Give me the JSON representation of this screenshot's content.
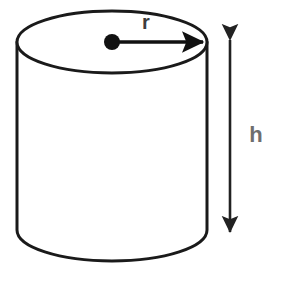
{
  "diagram": {
    "background_color": "#ffffff",
    "stroke_color": "#1a1a1a",
    "canvas": {
      "width": 281,
      "height": 281
    },
    "shape": {
      "name": "cylinder",
      "top_ellipse": {
        "cx": 112,
        "cy": 42,
        "rx": 95,
        "ry": 31
      },
      "bottom_arc": {
        "cx": 112,
        "cy": 230,
        "rx": 95,
        "ry": 31
      },
      "left_wall": {
        "x": 17,
        "y1": 42,
        "y2": 230
      },
      "right_wall": {
        "x": 207,
        "y1": 42,
        "y2": 230
      },
      "stroke_width": 3
    },
    "radius_marker": {
      "label": "r",
      "label_color": "#3d3d3d",
      "label_x": 146,
      "label_y": 29,
      "dot": {
        "cx": 112,
        "cy": 42,
        "r": 8
      },
      "arrow_from_x": 112,
      "arrow_to_x": 207,
      "arrow_y": 42,
      "color": "#111111"
    },
    "height_marker": {
      "label": "h",
      "label_color": "#6e6e6e",
      "label_x": 256,
      "label_y": 142,
      "arrow_x": 230,
      "arrow_top_y": 36,
      "arrow_bottom_y": 236,
      "color": "#222222"
    }
  }
}
